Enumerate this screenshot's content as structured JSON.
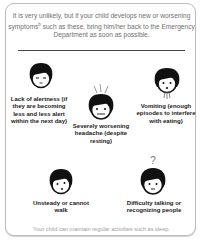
{
  "intro": {
    "text_part1": "It is very unlikely, but if your child develops new or worsening symptoms",
    "superscript": "b",
    "text_part2": " such as these, bring him/her back to the Emergency Department as soon as possible."
  },
  "symptoms": [
    {
      "id": "lack-of-alertness",
      "icon": "drowsy-face-icon",
      "label": "Lack of alertness (if they are becoming less and less alert within the next day)"
    },
    {
      "id": "severe-headache",
      "icon": "headache-face-icon",
      "label": "Severely worsening headache (despite resting)"
    },
    {
      "id": "vomiting",
      "icon": "vomiting-face-icon",
      "label": "Vomiting (enough episodes to interfere with eating)"
    },
    {
      "id": "unsteady",
      "icon": "dizzy-face-icon",
      "label": "Unsteady or cannot walk"
    },
    {
      "id": "difficulty-talking",
      "icon": "confused-face-icon",
      "label": "Difficulty talking or recognizing people"
    }
  ],
  "footer": "Your child can maintain regular activities such as sleep."
}
